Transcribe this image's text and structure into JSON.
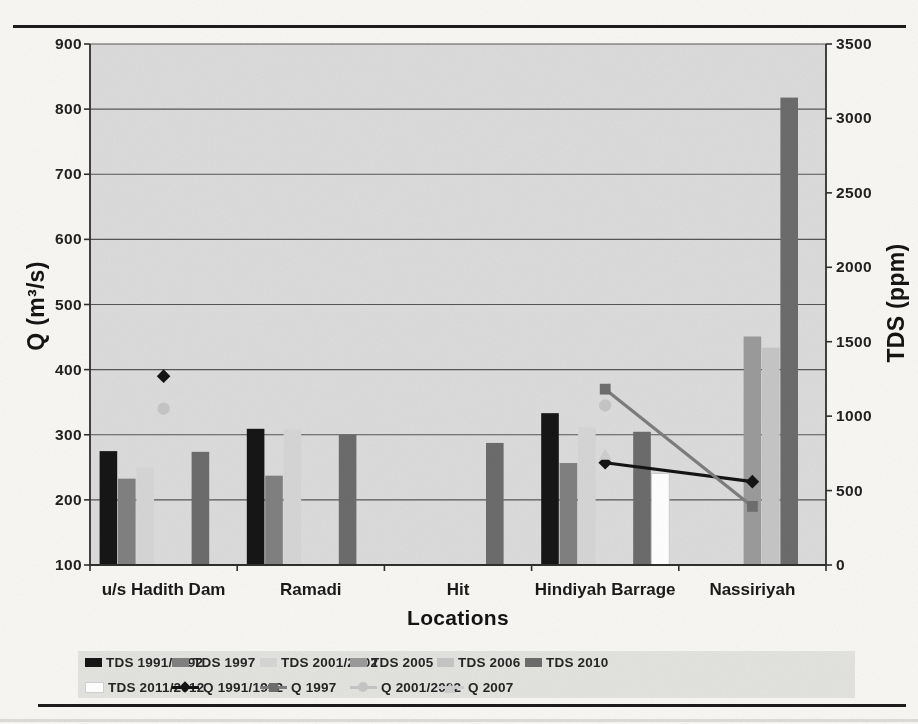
{
  "page": {
    "background": "#f8f7f4",
    "rule_color": "#1c1c1c"
  },
  "chart_data": {
    "type": "bar+line combo",
    "title": "",
    "xlabel": "Locations",
    "categories": [
      "u/s Hadith Dam",
      "Ramadi",
      "Hit",
      "Hindiyah Barrage",
      "Nassiriyah"
    ],
    "left_axis": {
      "label": "Q (m³/s)",
      "min": 100,
      "max": 900,
      "step": 100,
      "ticks": [
        "900",
        "800",
        "700",
        "600",
        "500",
        "400",
        "300",
        "200",
        "100"
      ]
    },
    "right_axis": {
      "label": "TDS (ppm)",
      "min": 0,
      "max": 3500,
      "step": 500,
      "ticks": [
        "3500",
        "3000",
        "2500",
        "2000",
        "1500",
        "1000",
        "500",
        "0"
      ]
    },
    "plot_bg": "#dcdcdc",
    "gridline_color": "#565656",
    "axis_color": "#2f2f2f",
    "grid": "horizontal gridlines at every 100 of left axis",
    "bar_series": [
      {
        "name": "TDS 1991/1992",
        "axis": "right",
        "color": "#161616",
        "values": [
          765,
          915,
          null,
          1020,
          null
        ]
      },
      {
        "name": "TDS 1997",
        "axis": "right",
        "color": "#818181",
        "values": [
          580,
          600,
          null,
          685,
          null
        ]
      },
      {
        "name": "TDS 2001/2002",
        "axis": "right",
        "color": "#d6d6d6",
        "values": [
          655,
          910,
          null,
          925,
          null
        ]
      },
      {
        "name": "TDS 2005",
        "axis": "right",
        "color": "#9b9b9b",
        "values": [
          null,
          null,
          null,
          null,
          1535
        ]
      },
      {
        "name": "TDS 2006",
        "axis": "right",
        "color": "#c6c6c6",
        "values": [
          null,
          null,
          null,
          null,
          1460
        ]
      },
      {
        "name": "TDS 2010",
        "axis": "right",
        "color": "#6c6c6c",
        "values": [
          760,
          875,
          820,
          895,
          3140
        ]
      },
      {
        "name": "TDS 2011/2012",
        "axis": "right",
        "color": "#ffffff",
        "stroke": "#c9c9c9",
        "values": [
          null,
          null,
          null,
          615,
          null
        ]
      }
    ],
    "line_series": [
      {
        "name": "Q 1991/1992",
        "axis": "left",
        "color": "#141414",
        "marker": "diamond",
        "marker_color": "#141414",
        "values": [
          390,
          null,
          null,
          257,
          228
        ]
      },
      {
        "name": "Q 1997",
        "axis": "left",
        "color": "#7d7d7d",
        "marker": "square",
        "marker_color": "#6e6e6e",
        "values": [
          null,
          null,
          null,
          370,
          190
        ]
      },
      {
        "name": "Q 2001/2002",
        "axis": "left",
        "color": "#c6c6c6",
        "marker": "circle",
        "marker_color": "#c6c6c6",
        "values": [
          340,
          null,
          null,
          345,
          null
        ]
      },
      {
        "name": "Q 2007",
        "axis": "left",
        "color": "#cfcfcf",
        "marker": "triangle",
        "marker_color": "#cfcfcf",
        "values": [
          null,
          null,
          null,
          270,
          null
        ]
      }
    ],
    "legend": {
      "bg": "#e3e3e0",
      "position": "bottom",
      "row1": [
        "TDS 1991/1992",
        "TDS 1997",
        "TDS 2001/2002",
        "TDS 2005",
        "TDS 2006",
        "TDS 2010"
      ],
      "row2": [
        "TDS 2011/2012",
        "Q 1991/1992",
        "Q 1997",
        "Q 2001/2002",
        "Q 2007"
      ]
    }
  }
}
